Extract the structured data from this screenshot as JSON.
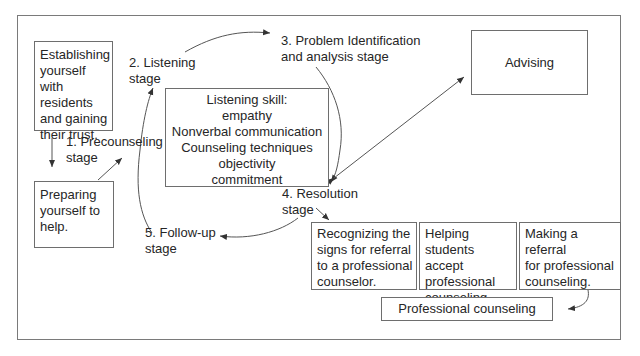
{
  "diagram": {
    "boxes": {
      "establishing": [
        "Establishing",
        "yourself with",
        "residents",
        "and gaining",
        "their trust."
      ],
      "preparing": [
        "Preparing",
        "yourself to",
        "help."
      ],
      "listening_skill": [
        "Listening skill:",
        "empathy",
        "Nonverbal communication",
        "Counseling techniques",
        "objectivity",
        "commitment"
      ],
      "advising": "Advising",
      "recognizing": [
        "Recognizing the",
        "signs for referral",
        "to a professional",
        "counselor."
      ],
      "helping": [
        "Helping",
        "students accept",
        "professional",
        "counseling."
      ],
      "making_referral": [
        "Making a",
        "referral",
        "for professional",
        "counseling."
      ],
      "professional_counseling": "Professional counseling"
    },
    "stages": {
      "precounseling": [
        "1. Precounseling",
        "stage"
      ],
      "listening": [
        "2. Listening",
        "stage"
      ],
      "problem_identification": [
        "3. Problem Identification",
        "and analysis stage"
      ],
      "resolution": [
        "4. Resolution",
        "stage"
      ],
      "follow_up": [
        "5. Follow-up",
        "stage"
      ]
    },
    "colors": {
      "line": "#6e6e6e",
      "text": "#262626",
      "background": "#ffffff"
    }
  }
}
